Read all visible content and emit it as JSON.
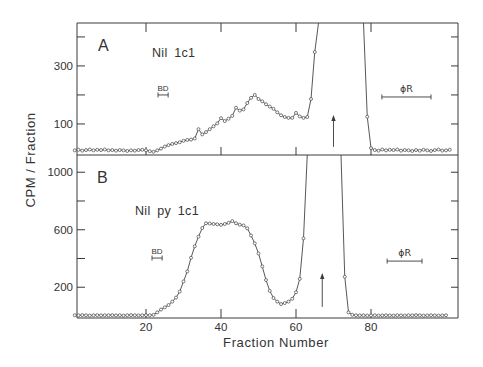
{
  "chart_data": {
    "type": "line",
    "title": "",
    "xlabel": "Fraction Number",
    "ylabel": "CPM / Fraction",
    "xlim": [
      1.6,
      103.2
    ],
    "xticks": [
      20,
      40,
      60,
      80
    ],
    "xtick_labels": [
      "20",
      "40",
      "60",
      "80"
    ],
    "grid": false,
    "legend": null,
    "marker": "open-circle",
    "panels": [
      {
        "label": "A",
        "sample": "Nil 1c1",
        "ylim": [
          -7,
          448
        ],
        "yticks": [
          100,
          200,
          300,
          400
        ],
        "ytick_labels": [
          "100",
          "",
          "300",
          ""
        ],
        "off_scale_fractions": [
          66,
          78
        ],
        "series": [
          {
            "name": "Nil 1c1",
            "x": [
              1,
              2,
              3,
              4,
              5,
              6,
              7,
              8,
              9,
              10,
              11,
              12,
              13,
              14,
              15,
              16,
              17,
              18,
              19,
              20,
              21,
              22,
              23,
              24,
              25,
              26,
              27,
              28,
              29,
              30,
              31,
              32,
              33,
              34,
              35,
              36,
              37,
              38,
              39,
              40,
              41,
              42,
              43,
              44,
              45,
              46,
              47,
              48,
              49,
              50,
              51,
              52,
              53,
              54,
              55,
              56,
              57,
              58,
              59,
              60,
              61,
              62,
              63,
              64,
              65,
              66,
              67,
              68,
              69,
              70,
              71,
              72,
              73,
              74,
              75,
              76,
              77,
              78,
              79,
              80,
              81,
              82,
              83,
              84,
              85,
              86,
              87,
              88,
              89,
              90,
              91,
              92,
              93,
              94,
              95,
              96,
              97,
              98,
              99,
              100,
              101
            ],
            "y": [
              9,
              11,
              8,
              10,
              12,
              9,
              11,
              10,
              12,
              9,
              10,
              8,
              10,
              9,
              7,
              9,
              8,
              10,
              11,
              9,
              6,
              4,
              9,
              15,
              22,
              27,
              31,
              34,
              37,
              42,
              45,
              46,
              50,
              82,
              64,
              72,
              82,
              92,
              102,
              120,
              110,
              118,
              128,
              156,
              146,
              150,
              172,
              190,
              200,
              186,
              178,
              168,
              160,
              152,
              140,
              130,
              124,
              121,
              121,
              138,
              126,
              121,
              124,
              186,
              348,
              null,
              null,
              null,
              null,
              null,
              null,
              null,
              null,
              null,
              null,
              null,
              null,
              null,
              125,
              17,
              10,
              8,
              12,
              9,
              11,
              10,
              12,
              8,
              10,
              9,
              7,
              10,
              8,
              11,
              9,
              7,
              10,
              12,
              8,
              9,
              11
            ]
          }
        ],
        "annotations": [
          {
            "type": "range-bar",
            "text": "BD",
            "x": [
              23.2,
              25.9
            ],
            "y": 200
          },
          {
            "type": "range-bar",
            "text": "ϕR",
            "x": [
              82.9,
              96.0
            ],
            "y": 193
          },
          {
            "type": "arrow",
            "x": 70,
            "y": [
              21,
              131
            ]
          }
        ]
      },
      {
        "label": "B",
        "sample": "Nil py 1c1",
        "ylim": [
          -14,
          1120
        ],
        "yticks": [
          200,
          400,
          600,
          800,
          1000
        ],
        "ytick_labels": [
          "200",
          "",
          "600",
          "",
          "1000"
        ],
        "off_scale_fractions": [
          63,
          72
        ],
        "series": [
          {
            "name": "Nil py 1c1",
            "x": [
              1,
              2,
              3,
              4,
              5,
              6,
              7,
              8,
              9,
              10,
              11,
              12,
              13,
              14,
              15,
              16,
              17,
              18,
              19,
              20,
              21,
              22,
              23,
              24,
              25,
              26,
              27,
              28,
              29,
              30,
              31,
              32,
              33,
              34,
              35,
              36,
              37,
              38,
              39,
              40,
              41,
              42,
              43,
              44,
              45,
              46,
              47,
              48,
              49,
              50,
              51,
              52,
              53,
              54,
              55,
              56,
              57,
              58,
              59,
              60,
              61,
              62,
              63,
              64,
              65,
              66,
              67,
              68,
              69,
              70,
              71,
              72,
              73,
              74,
              75,
              76,
              77,
              78,
              79,
              80,
              81,
              82,
              83,
              84,
              85,
              86,
              87,
              88,
              89,
              90,
              91,
              92,
              93,
              94,
              95,
              96,
              97,
              98,
              99,
              100
            ],
            "y": [
              5,
              4,
              6,
              5,
              3,
              5,
              6,
              4,
              5,
              5,
              6,
              4,
              5,
              3,
              5,
              6,
              5,
              4,
              5,
              6,
              5,
              8,
              25,
              45,
              60,
              76,
              100,
              128,
              170,
              240,
              310,
              405,
              485,
              552,
              612,
              645,
              643,
              640,
              638,
              634,
              640,
              648,
              660,
              645,
              635,
              630,
              610,
              560,
              505,
              435,
              345,
              250,
              175,
              125,
              100,
              83,
              90,
              100,
              120,
              165,
              258,
              540,
              null,
              null,
              null,
              null,
              null,
              null,
              null,
              null,
              null,
              null,
              273,
              25,
              8,
              5,
              4,
              5,
              3,
              4,
              5,
              3,
              4,
              5,
              4,
              3,
              5,
              4,
              3,
              5,
              4,
              6,
              5,
              3,
              4,
              5,
              4,
              3,
              4,
              5
            ]
          }
        ],
        "annotations": [
          {
            "type": "range-bar",
            "text": "BD",
            "x": [
              21.6,
              24.3
            ],
            "y": 403
          },
          {
            "type": "range-bar",
            "text": "ϕR",
            "x": [
              84.3,
              93.6
            ],
            "y": 382
          },
          {
            "type": "arrow",
            "x": 67,
            "y": [
              63,
              299
            ]
          }
        ]
      }
    ]
  }
}
